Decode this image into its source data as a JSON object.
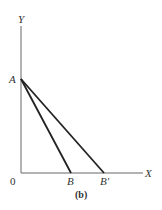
{
  "diagram": {
    "caption": "(b)",
    "labels": {
      "y_axis": "Y",
      "x_axis": "X",
      "origin": "0",
      "point_a": "A",
      "point_b": "B",
      "point_b_prime": "B'"
    },
    "colors": {
      "axis": "#666666",
      "line": "#222222",
      "text": "#333333"
    }
  }
}
